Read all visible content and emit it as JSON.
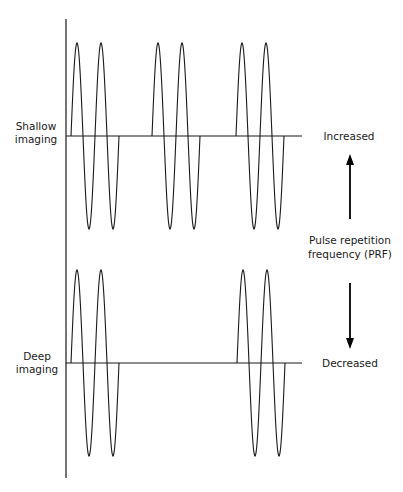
{
  "diagram": {
    "title": "",
    "rows": [
      {
        "id": "shallow",
        "label_lines": [
          "Shallow",
          "imaging"
        ],
        "side_label": "Increased",
        "pulse_count": 3,
        "cycles_per_pulse": 2
      },
      {
        "id": "deep",
        "label_lines": [
          "Deep",
          "imaging"
        ],
        "side_label": "Decreased",
        "pulse_count": 2,
        "cycles_per_pulse": 2
      }
    ],
    "center_label_lines": [
      "Pulse repetition",
      "frequency (PRF)"
    ],
    "arrows": [
      {
        "id": "up",
        "direction": "up",
        "meaning": "PRF increased"
      },
      {
        "id": "down",
        "direction": "down",
        "meaning": "PRF decreased"
      }
    ],
    "colors": {
      "ink": "#1a1a1a",
      "background": "#ffffff"
    }
  }
}
